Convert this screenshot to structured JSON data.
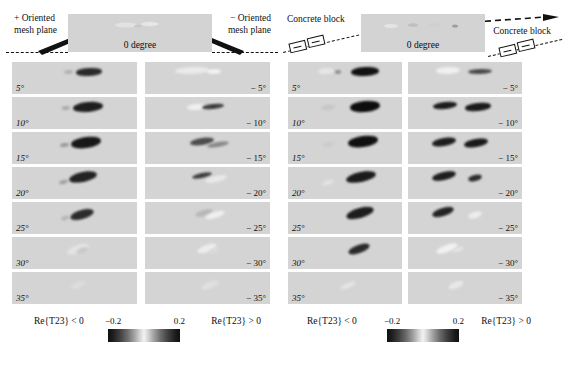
{
  "figure": {
    "colorbar": {
      "min_label": "−0.2",
      "max_label": "0.2",
      "left_condition": "Re{T23} < 0",
      "right_condition": "Re{T23} > 0"
    },
    "zero_label": "0 degree"
  },
  "panels": [
    {
      "id": "left",
      "header": {
        "left_annotation": "+ Oriented\nmesh plane",
        "left_annotation_line1": "+ Oriented",
        "left_annotation_line2": "mesh plane",
        "right_annotation_line1": "− Oriented",
        "right_annotation_line2": "mesh plane",
        "zero_label": "0 degree",
        "target_glyph": "none"
      },
      "rows": [
        {
          "left_label": "5°",
          "right_label": "− 5°",
          "left_blobs": [
            {
              "x": 52,
              "y": 8,
              "w": 9,
              "h": 4,
              "tone": "#b0b0b0",
              "rot": -4
            },
            {
              "x": 64,
              "y": 6,
              "w": 26,
              "h": 8,
              "tone": "#2a2a2a",
              "rot": -3
            }
          ],
          "right_blobs": [
            {
              "x": 30,
              "y": 5,
              "w": 34,
              "h": 7,
              "tone": "#eaeaea",
              "rot": -2
            },
            {
              "x": 62,
              "y": 7,
              "w": 14,
              "h": 5,
              "tone": "#f2f2f2",
              "rot": -2
            }
          ]
        },
        {
          "left_label": "10°",
          "right_label": "− 10°",
          "left_blobs": [
            {
              "x": 50,
              "y": 9,
              "w": 8,
              "h": 4,
              "tone": "#a8a8a8",
              "rot": -6
            },
            {
              "x": 61,
              "y": 5,
              "w": 30,
              "h": 10,
              "tone": "#1e1e1e",
              "rot": -5
            }
          ],
          "right_blobs": [
            {
              "x": 42,
              "y": 7,
              "w": 18,
              "h": 6,
              "tone": "#efefef",
              "rot": -5
            },
            {
              "x": 57,
              "y": 7,
              "w": 22,
              "h": 5,
              "tone": "#3a3a3a",
              "rot": -6
            }
          ]
        },
        {
          "left_label": "15°",
          "right_label": "− 15°",
          "left_blobs": [
            {
              "x": 48,
              "y": 11,
              "w": 9,
              "h": 4,
              "tone": "#9a9a9a",
              "rot": -9
            },
            {
              "x": 59,
              "y": 5,
              "w": 30,
              "h": 11,
              "tone": "#181818",
              "rot": -8
            }
          ],
          "right_blobs": [
            {
              "x": 45,
              "y": 6,
              "w": 24,
              "h": 7,
              "tone": "#4d4d4d",
              "rot": -9
            },
            {
              "x": 62,
              "y": 10,
              "w": 22,
              "h": 5,
              "tone": "#8a8a8a",
              "rot": -10
            }
          ]
        },
        {
          "left_label": "20°",
          "right_label": "− 20°",
          "left_blobs": [
            {
              "x": 47,
              "y": 13,
              "w": 9,
              "h": 4,
              "tone": "#9f9f9f",
              "rot": -13
            },
            {
              "x": 57,
              "y": 5,
              "w": 28,
              "h": 10,
              "tone": "#232323",
              "rot": -12
            }
          ],
          "right_blobs": [
            {
              "x": 47,
              "y": 6,
              "w": 20,
              "h": 5,
              "tone": "#3f3f3f",
              "rot": -12
            },
            {
              "x": 60,
              "y": 9,
              "w": 22,
              "h": 6,
              "tone": "#e8e8e8",
              "rot": -13
            }
          ]
        },
        {
          "left_label": "25°",
          "right_label": "− 25°",
          "left_blobs": [
            {
              "x": 49,
              "y": 14,
              "w": 8,
              "h": 4,
              "tone": "#b4b4b4",
              "rot": -17
            },
            {
              "x": 58,
              "y": 8,
              "w": 24,
              "h": 9,
              "tone": "#2c2c2c",
              "rot": -16
            }
          ],
          "right_blobs": [
            {
              "x": 50,
              "y": 8,
              "w": 18,
              "h": 6,
              "tone": "#b8b8b8",
              "rot": -16
            },
            {
              "x": 60,
              "y": 10,
              "w": 20,
              "h": 6,
              "tone": "#efefef",
              "rot": -17
            }
          ]
        },
        {
          "left_label": "30°",
          "right_label": "− 30°",
          "left_blobs": [
            {
              "x": 55,
              "y": 8,
              "w": 22,
              "h": 8,
              "tone": "#e3e3e3",
              "rot": -20
            },
            {
              "x": 64,
              "y": 11,
              "w": 12,
              "h": 5,
              "tone": "#c8c8c8",
              "rot": -20
            }
          ],
          "right_blobs": [
            {
              "x": 52,
              "y": 8,
              "w": 20,
              "h": 7,
              "tone": "#ededed",
              "rot": -20
            },
            {
              "x": 63,
              "y": 11,
              "w": 12,
              "h": 5,
              "tone": "#dadada",
              "rot": -21
            }
          ]
        },
        {
          "left_label": "35°",
          "right_label": "− 35°",
          "left_blobs": [
            {
              "x": 58,
              "y": 10,
              "w": 16,
              "h": 6,
              "tone": "#dcdcdc",
              "rot": -23
            }
          ],
          "right_blobs": [
            {
              "x": 56,
              "y": 10,
              "w": 18,
              "h": 6,
              "tone": "#e0e0e0",
              "rot": -23
            }
          ]
        }
      ]
    },
    {
      "id": "right",
      "header": {
        "left_annotation_line1": "Concrete block",
        "left_annotation_line2": "",
        "right_annotation_line1": "Concrete block",
        "right_annotation_line2": "",
        "zero_label": "0 degree",
        "target_glyph": "concrete-block"
      },
      "rows": [
        {
          "left_label": "5°",
          "right_label": "− 5°",
          "left_blobs": [
            {
              "x": 30,
              "y": 6,
              "w": 16,
              "h": 6,
              "tone": "#e6e6e6",
              "rot": -3
            },
            {
              "x": 47,
              "y": 8,
              "w": 6,
              "h": 4,
              "tone": "#8e8e8e",
              "rot": -3
            },
            {
              "x": 63,
              "y": 5,
              "w": 28,
              "h": 9,
              "tone": "#111111",
              "rot": -3
            }
          ],
          "right_blobs": [
            {
              "x": 28,
              "y": 5,
              "w": 24,
              "h": 7,
              "tone": "#f0f0f0",
              "rot": -2
            },
            {
              "x": 60,
              "y": 7,
              "w": 24,
              "h": 5,
              "tone": "#4a4a4a",
              "rot": -2
            }
          ]
        },
        {
          "left_label": "10°",
          "right_label": "− 10°",
          "left_blobs": [
            {
              "x": 33,
              "y": 8,
              "w": 14,
              "h": 5,
              "tone": "#c6c6c6",
              "rot": -6
            },
            {
              "x": 62,
              "y": 4,
              "w": 30,
              "h": 11,
              "tone": "#0d0d0d",
              "rot": -5
            }
          ],
          "right_blobs": [
            {
              "x": 25,
              "y": 5,
              "w": 24,
              "h": 7,
              "tone": "#1c1c1c",
              "rot": -6
            },
            {
              "x": 57,
              "y": 6,
              "w": 26,
              "h": 8,
              "tone": "#1a1a1a",
              "rot": -6
            }
          ]
        },
        {
          "left_label": "15°",
          "right_label": "− 15°",
          "left_blobs": [
            {
              "x": 34,
              "y": 10,
              "w": 12,
              "h": 5,
              "tone": "#cccccc",
              "rot": -9
            },
            {
              "x": 60,
              "y": 4,
              "w": 30,
              "h": 11,
              "tone": "#101010",
              "rot": -8
            }
          ],
          "right_blobs": [
            {
              "x": 24,
              "y": 6,
              "w": 24,
              "h": 8,
              "tone": "#1e1e1e",
              "rot": -10
            },
            {
              "x": 56,
              "y": 7,
              "w": 24,
              "h": 8,
              "tone": "#1a1a1a",
              "rot": -10
            }
          ]
        },
        {
          "left_label": "20°",
          "right_label": "− 20°",
          "left_blobs": [
            {
              "x": 34,
              "y": 13,
              "w": 12,
              "h": 5,
              "tone": "#e2e2e2",
              "rot": -13
            },
            {
              "x": 58,
              "y": 5,
              "w": 30,
              "h": 10,
              "tone": "#1c1c1c",
              "rot": -12
            }
          ],
          "right_blobs": [
            {
              "x": 24,
              "y": 5,
              "w": 24,
              "h": 8,
              "tone": "#1f1f1f",
              "rot": -13
            },
            {
              "x": 60,
              "y": 8,
              "w": 14,
              "h": 6,
              "tone": "#2e2e2e",
              "rot": -14
            }
          ]
        },
        {
          "left_label": "25°",
          "right_label": "− 25°",
          "left_blobs": [
            {
              "x": 58,
              "y": 6,
              "w": 28,
              "h": 10,
              "tone": "#1d1d1d",
              "rot": -16
            }
          ],
          "right_blobs": [
            {
              "x": 24,
              "y": 6,
              "w": 22,
              "h": 8,
              "tone": "#232323",
              "rot": -17
            },
            {
              "x": 60,
              "y": 10,
              "w": 14,
              "h": 6,
              "tone": "#ededed",
              "rot": -17
            }
          ]
        },
        {
          "left_label": "30°",
          "right_label": "− 30°",
          "left_blobs": [
            {
              "x": 60,
              "y": 8,
              "w": 22,
              "h": 8,
              "tone": "#2a2a2a",
              "rot": -20
            }
          ],
          "right_blobs": [
            {
              "x": 28,
              "y": 8,
              "w": 22,
              "h": 7,
              "tone": "#f1f1f1",
              "rot": -20
            },
            {
              "x": 44,
              "y": 10,
              "w": 12,
              "h": 5,
              "tone": "#e2e2e2",
              "rot": -20
            }
          ]
        },
        {
          "left_label": "35°",
          "right_label": "− 35°",
          "left_blobs": [
            {
              "x": 52,
              "y": 11,
              "w": 16,
              "h": 5,
              "tone": "#e4e4e4",
              "rot": -22
            }
          ],
          "right_blobs": [
            {
              "x": 40,
              "y": 10,
              "w": 16,
              "h": 6,
              "tone": "#e8e8e8",
              "rot": -22
            }
          ]
        }
      ]
    }
  ]
}
